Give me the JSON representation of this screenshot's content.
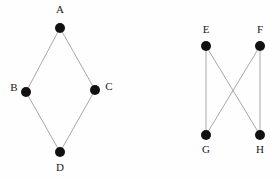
{
  "figure": {
    "background_color": "#fefefe",
    "width": 280,
    "height": 179
  },
  "style": {
    "node_color": "#111111",
    "node_radius": 5,
    "edge_color": "#a8a8a8",
    "edge_width": 1,
    "label_color": "#1a1a1a",
    "label_font_size": 11
  },
  "graphs": [
    {
      "id": "graph-left",
      "name": "diamond-graph",
      "nodes": [
        {
          "id": "A",
          "label": "A",
          "x": 60,
          "y": 28,
          "label_x": 60,
          "label_y": 10
        },
        {
          "id": "B",
          "label": "B",
          "x": 26,
          "y": 92,
          "label_x": 14,
          "label_y": 88
        },
        {
          "id": "C",
          "label": "C",
          "x": 95,
          "y": 90,
          "label_x": 109,
          "label_y": 87
        },
        {
          "id": "D",
          "label": "D",
          "x": 60,
          "y": 152,
          "label_x": 60,
          "label_y": 168
        }
      ],
      "edges": [
        {
          "from": "A",
          "to": "B"
        },
        {
          "from": "A",
          "to": "C"
        },
        {
          "from": "B",
          "to": "D"
        },
        {
          "from": "C",
          "to": "D"
        }
      ]
    },
    {
      "id": "graph-right",
      "name": "crossing-graph",
      "nodes": [
        {
          "id": "E",
          "label": "E",
          "x": 206,
          "y": 46,
          "label_x": 206,
          "label_y": 30
        },
        {
          "id": "F",
          "label": "F",
          "x": 260,
          "y": 46,
          "label_x": 260,
          "label_y": 30
        },
        {
          "id": "G",
          "label": "G",
          "x": 206,
          "y": 135,
          "label_x": 206,
          "label_y": 150
        },
        {
          "id": "H",
          "label": "H",
          "x": 260,
          "y": 135,
          "label_x": 260,
          "label_y": 150
        }
      ],
      "edges": [
        {
          "from": "E",
          "to": "G"
        },
        {
          "from": "E",
          "to": "H"
        },
        {
          "from": "F",
          "to": "G"
        },
        {
          "from": "F",
          "to": "H"
        }
      ]
    }
  ]
}
